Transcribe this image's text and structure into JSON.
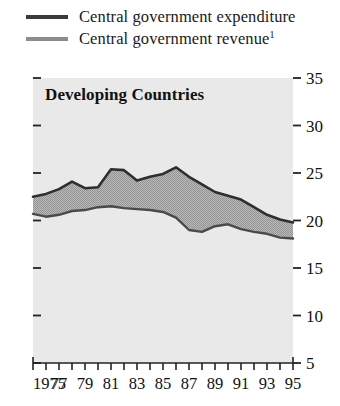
{
  "legend": {
    "items": [
      {
        "label": "Central government expenditure",
        "color": "#3a3a3a",
        "swatch": "legend-line-expenditure"
      },
      {
        "label": "Central government revenue",
        "footnote": "1",
        "color": "#8c8c8c",
        "swatch": "legend-line-revenue"
      }
    ]
  },
  "panel": {
    "title": "Developing Countries",
    "background": "#e9e9e9",
    "fill_color": "#a9a9a9"
  },
  "chart_data": {
    "type": "area",
    "title": "Developing Countries",
    "xlabel": "",
    "ylabel": "",
    "xlim": [
      1975,
      1995
    ],
    "ylim": [
      5,
      35
    ],
    "yticks": [
      5,
      10,
      15,
      20,
      25,
      30,
      35
    ],
    "ytick_labels": [
      "5",
      "10",
      "15",
      "20",
      "25",
      "30",
      "35"
    ],
    "xticks": [
      1975,
      1976,
      1977,
      1978,
      1979,
      1980,
      1981,
      1982,
      1983,
      1984,
      1985,
      1986,
      1987,
      1988,
      1989,
      1990,
      1991,
      1992,
      1993,
      1994,
      1995
    ],
    "xtick_labels": [
      "1975",
      "",
      "77",
      "",
      "79",
      "",
      "81",
      "",
      "83",
      "",
      "85",
      "",
      "87",
      "",
      "89",
      "",
      "91",
      "",
      "93",
      "",
      "95"
    ],
    "grid": false,
    "legend_position": "above-plot",
    "x": [
      1975,
      1976,
      1977,
      1978,
      1979,
      1980,
      1981,
      1982,
      1983,
      1984,
      1985,
      1986,
      1987,
      1988,
      1989,
      1990,
      1991,
      1992,
      1993,
      1994,
      1995
    ],
    "series": [
      {
        "name": "Central government expenditure",
        "color": "#3a3a3a",
        "values": [
          22.5,
          22.8,
          23.3,
          24.1,
          23.4,
          23.5,
          25.4,
          25.3,
          24.2,
          24.6,
          24.9,
          25.6,
          24.6,
          23.8,
          23.0,
          22.6,
          22.2,
          21.4,
          20.6,
          20.1,
          19.8
        ]
      },
      {
        "name": "Central government revenue",
        "color": "#8c8c8c",
        "values": [
          20.7,
          20.4,
          20.6,
          21.0,
          21.1,
          21.4,
          21.5,
          21.3,
          21.2,
          21.1,
          20.9,
          20.3,
          19.0,
          18.8,
          19.4,
          19.6,
          19.1,
          18.8,
          18.6,
          18.2,
          18.1
        ]
      }
    ],
    "annotations": [
      {
        "text": "Central government revenue",
        "footnote_marker": "1"
      }
    ]
  }
}
